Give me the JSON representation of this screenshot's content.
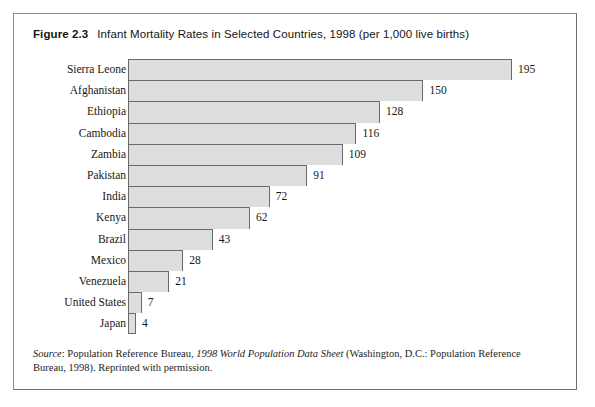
{
  "figure": {
    "number": "Figure 2.3",
    "caption": "Infant Mortality Rates in Selected Countries, 1998 (per 1,000 live births)"
  },
  "source_note": {
    "label": "Source",
    "colon": ": ",
    "org": "Population Reference Bureau, ",
    "publication": "1998 World Population Data Sheet",
    "rest": " (Washington, D.C.: Population Reference Bureau, 1998). Reprinted with permission."
  },
  "chart_data": {
    "type": "bar",
    "orientation": "horizontal",
    "title": "Infant Mortality Rates in Selected Countries, 1998 (per 1,000 live births)",
    "xlabel": "",
    "ylabel": "",
    "xlim": [
      0,
      195
    ],
    "grid": false,
    "legend": null,
    "value_unit": "deaths per 1,000 live births",
    "year": 1998,
    "categories": [
      "Sierra Leone",
      "Afghanistan",
      "Ethiopia",
      "Cambodia",
      "Zambia",
      "Pakistan",
      "India",
      "Kenya",
      "Brazil",
      "Mexico",
      "Venezuela",
      "United States",
      "Japan"
    ],
    "values": [
      195,
      150,
      128,
      116,
      109,
      91,
      72,
      62,
      43,
      28,
      21,
      7,
      4
    ],
    "bar_fill_color": "#dedede",
    "bar_border_color": "#6a6a6a"
  }
}
